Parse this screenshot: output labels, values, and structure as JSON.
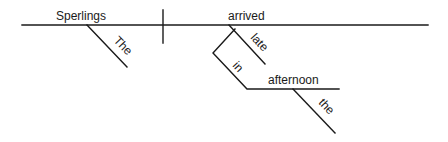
{
  "diagram": {
    "type": "sentence-diagram",
    "sentence_words": [
      "The",
      "Sperlings",
      "arrived",
      "late",
      "in",
      "the",
      "afternoon"
    ],
    "subject": {
      "word": "Sperlings",
      "modifiers": [
        "The"
      ]
    },
    "predicate": {
      "word": "arrived",
      "modifiers": [
        "late"
      ],
      "prepositional_phrase": {
        "preposition": "in",
        "object": {
          "word": "afternoon",
          "modifiers": [
            "the"
          ]
        }
      }
    },
    "labels": {
      "subject": "Sperlings",
      "subject_article": "The",
      "verb": "arrived",
      "adverb": "late",
      "preposition": "in",
      "object": "afternoon",
      "object_article": "the"
    },
    "colors": {
      "line": "#1a1a1a",
      "text": "#1a1a1a",
      "background": "#ffffff"
    }
  }
}
